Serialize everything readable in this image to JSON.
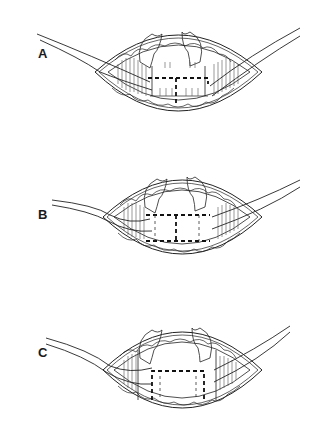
{
  "figure": {
    "panels": [
      {
        "id": "A",
        "label": "A",
        "incision": "T-shaped",
        "top": 0,
        "center_y": 72,
        "label_x": 38,
        "label_y": 46
      },
      {
        "id": "B",
        "label": "B",
        "incision": "I-shaped (H-shaped) rectangular",
        "top": 145,
        "center_y": 217,
        "label_x": 38,
        "label_y": 207
      },
      {
        "id": "C",
        "label": "C",
        "incision": "U-shaped rectangular flap",
        "top": 290,
        "center_y": 370,
        "label_x": 38,
        "label_y": 345
      }
    ],
    "colors": {
      "line": "#222222",
      "background": "#ffffff",
      "hatch": "#555555"
    }
  }
}
